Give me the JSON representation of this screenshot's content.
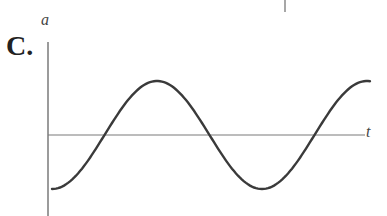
{
  "option": {
    "label": "C."
  },
  "axes": {
    "y_label": "a",
    "x_label": "t"
  },
  "colors": {
    "axis": "#7a7a7a",
    "curve": "#3a3a3a",
    "text": "#222222"
  },
  "chart_data": {
    "type": "line",
    "title": "",
    "xlabel": "t",
    "ylabel": "a",
    "x": [
      0,
      0.25,
      0.5,
      0.75,
      1.0,
      1.25,
      1.5
    ],
    "y": [
      -1,
      0,
      1,
      0,
      -1,
      0,
      1
    ],
    "grid": false,
    "legend": null
  }
}
